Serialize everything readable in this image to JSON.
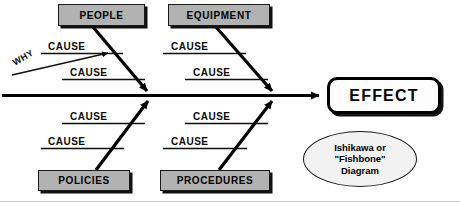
{
  "diagram": {
    "title": "Ishikawa or \"Fishbone\" Diagram",
    "type": "fishbone",
    "spine": {
      "label": "main-spine-arrow",
      "direction": "left-to-right"
    },
    "effect": {
      "label": "EFFECT"
    },
    "caption": {
      "line1": "Ishikawa or",
      "line2": "\"Fishbone\"",
      "line3": "Diagram"
    },
    "why_annotation": {
      "label": "WHY"
    },
    "categories": [
      {
        "id": "people",
        "label": "PEOPLE",
        "position": "top-left",
        "causes": [
          {
            "label": "CAUSE"
          },
          {
            "label": "CAUSE"
          }
        ]
      },
      {
        "id": "equipment",
        "label": "EQUIPMENT",
        "position": "top-right",
        "causes": [
          {
            "label": "CAUSE"
          },
          {
            "label": "CAUSE"
          }
        ]
      },
      {
        "id": "policies",
        "label": "POLICIES",
        "position": "bottom-left",
        "causes": [
          {
            "label": "CAUSE"
          },
          {
            "label": "CAUSE"
          }
        ]
      },
      {
        "id": "procedures",
        "label": "PROCEDURES",
        "position": "bottom-right",
        "causes": [
          {
            "label": "CAUSE"
          },
          {
            "label": "CAUSE"
          }
        ]
      }
    ],
    "colors": {
      "category_fill": "#b2b2b2",
      "category_border": "#1a1a1a",
      "effect_fill": "#fdfdfd",
      "effect_border": "#000000",
      "caption_fill": "#f2f2f2",
      "line": "#000000",
      "background": "#ffffff"
    }
  }
}
